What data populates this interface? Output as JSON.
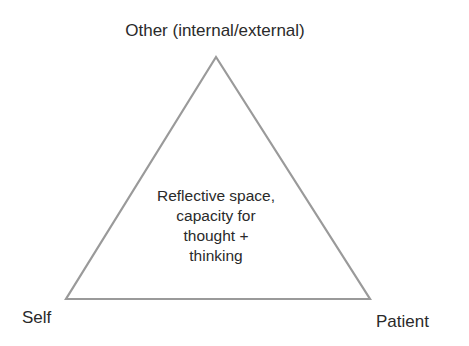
{
  "diagram": {
    "type": "triangle",
    "vertices": {
      "top": "Other (internal/external)",
      "bottom_left": "Self",
      "bottom_right": "Patient"
    },
    "center_text": [
      "Reflective space,",
      "capacity for",
      "thought +",
      "thinking"
    ],
    "colors": {
      "line": "#9a9a9a",
      "text": "#2a2a2a",
      "background": "#ffffff"
    }
  }
}
